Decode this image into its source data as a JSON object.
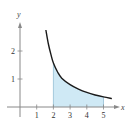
{
  "chart_data": {
    "type": "line",
    "title": "",
    "xlabel": "x",
    "ylabel": "y",
    "xlim": [
      -0.8,
      5.9
    ],
    "ylim": [
      -0.4,
      3.0
    ],
    "x_ticks": [
      "1",
      "2",
      "3",
      "4",
      "5"
    ],
    "y_ticks": [
      "1",
      "2"
    ],
    "grid": false,
    "legend": null,
    "series": [
      {
        "name": "curve",
        "x": [
          1.55,
          1.7,
          1.85,
          2.0,
          2.25,
          2.5,
          3.0,
          3.5,
          4.0,
          4.5,
          5.0,
          5.5
        ],
        "y": [
          2.75,
          2.25,
          1.88,
          1.57,
          1.25,
          1.03,
          0.8,
          0.64,
          0.52,
          0.43,
          0.36,
          0.3
        ]
      }
    ],
    "shaded_region": {
      "from_x": 2,
      "to_x": 5,
      "below": "curve",
      "above": "x-axis",
      "color": "#cfe9f5"
    },
    "colors": {
      "curve": "#1a1a1a",
      "axes": "#888888",
      "fill": "#cfe9f5",
      "fill_edge": "#8ab8d0"
    }
  }
}
